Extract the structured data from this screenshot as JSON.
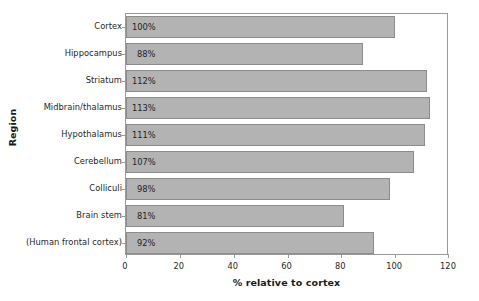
{
  "chart_data": {
    "type": "bar",
    "orientation": "horizontal",
    "title": "",
    "xlabel": "% relative to cortex",
    "ylabel": "Region",
    "xlim": [
      0,
      120
    ],
    "xticks": [
      0,
      20,
      40,
      60,
      80,
      100,
      120
    ],
    "grid": false,
    "legend": null,
    "bar_color": "#b3b3b3",
    "bar_border_color": "#8c8c8c",
    "categories": [
      "Cortex",
      "Hippocampus",
      "Striatum",
      "Midbrain/thalamus",
      "Hypothalamus",
      "Cerebellum",
      "Colliculi",
      "Brain stem",
      "(Human frontal cortex)"
    ],
    "values": [
      100,
      88,
      112,
      113,
      111,
      107,
      98,
      81,
      92
    ],
    "data_labels": [
      "100%",
      "88%",
      "112%",
      "113%",
      "111%",
      "107%",
      "98%",
      "81%",
      "92%"
    ],
    "tick_labels": [
      "0",
      "20",
      "40",
      "60",
      "80",
      "100",
      "120"
    ]
  }
}
